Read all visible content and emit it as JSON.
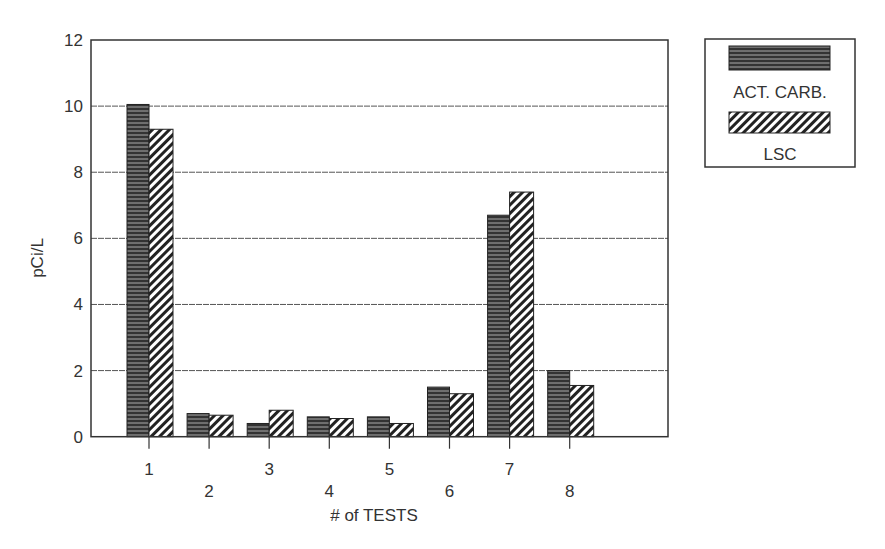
{
  "chart_data": {
    "type": "bar",
    "title": "",
    "xlabel": "# of TESTS",
    "ylabel": "pCi/L",
    "ylim": [
      0,
      12
    ],
    "yticks": [
      0,
      2,
      4,
      6,
      8,
      10,
      12
    ],
    "grid": true,
    "legend_position": "upper right, outside plot",
    "categories": [
      "1",
      "2",
      "3",
      "4",
      "5",
      "6",
      "7",
      "8"
    ],
    "series": [
      {
        "name": "ACT. CARB.",
        "pattern": "horizontal-lines",
        "values": [
          10.05,
          0.7,
          0.4,
          0.6,
          0.6,
          1.5,
          6.7,
          2.0
        ]
      },
      {
        "name": "LSC",
        "pattern": "diagonal-hatch",
        "values": [
          9.3,
          0.65,
          0.8,
          0.55,
          0.4,
          1.3,
          7.4,
          1.55
        ]
      }
    ]
  }
}
